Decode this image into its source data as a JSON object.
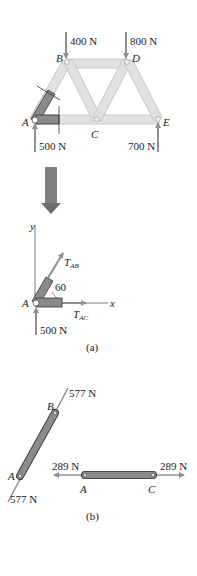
{
  "colors": {
    "member_light": "#e1e1e1",
    "member_light_stroke": "#c8c8c8",
    "member_dark": "#8a8a8a",
    "member_dark_stroke": "#333333",
    "arrow": "#8f8f8f",
    "text": "#222222"
  },
  "truss": {
    "joints": {
      "A": "A",
      "B": "B",
      "C": "C",
      "D": "D",
      "E": "E"
    },
    "loads": {
      "B": "400 N",
      "D": "800 N",
      "A_reaction": "500 N",
      "E_reaction": "700 N"
    }
  },
  "fbd_a": {
    "axis_x": "x",
    "axis_y": "y",
    "joint": "A",
    "tab": {
      "main": "T",
      "sub": "AB"
    },
    "tac": {
      "main": "T",
      "sub": "AC"
    },
    "angle": "60",
    "reaction": "500 N",
    "caption": "(a)"
  },
  "fbd_b": {
    "ab_member": {
      "end1": "A",
      "end2": "B",
      "force_top": "577 N",
      "force_bottom": "577 N"
    },
    "ac_member": {
      "end1": "A",
      "end2": "C",
      "force_left": "289 N",
      "force_right": "289 N"
    },
    "caption": "(b)"
  }
}
